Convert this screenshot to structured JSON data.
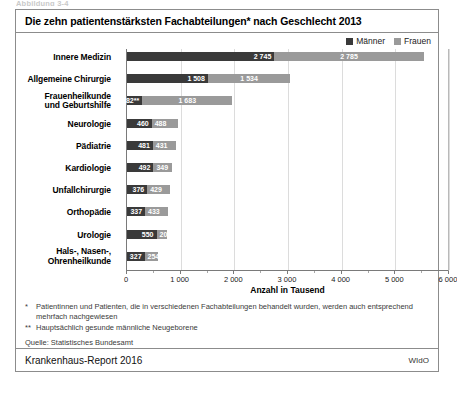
{
  "pre_caption": "Abbildung 3-4",
  "figure": {
    "title": "Die zehn patientenstärksten Fachabteilungen* nach Geschlecht 2013",
    "legend": [
      {
        "label": "Männer",
        "color": "#3a3a3a"
      },
      {
        "label": "Frauen",
        "color": "#9a9a9a"
      }
    ],
    "notes": [
      {
        "mark": "*",
        "text": "Patientinnen und Patienten, die in verschiedenen Fachabteilungen behandelt wurden, werden auch entsprechend mehrfach nachgewiesen"
      },
      {
        "mark": "**",
        "text": "Hauptsächlich gesunde männliche Neugeborene"
      }
    ],
    "source": "Quelle: Statistisches Bundesamt",
    "footer_left": "Krankenhaus-Report 2016",
    "footer_right": "WIdO"
  },
  "chart_data": {
    "type": "bar",
    "orientation": "horizontal",
    "stacked": true,
    "title": "Die zehn patientenstärksten Fachabteilungen* nach Geschlecht 2013",
    "xlabel": "Anzahl in Tausend",
    "ylabel": "",
    "xlim": [
      0,
      6000
    ],
    "xticks": [
      0,
      1000,
      2000,
      3000,
      4000,
      5000,
      6000
    ],
    "xticklabels": [
      "0",
      "1 000",
      "2 000",
      "3 000",
      "4 000",
      "5 000",
      "6 000"
    ],
    "grid": true,
    "legend_position": "top-right",
    "categories": [
      "Innere Medizin",
      "Allgemeine Chirurgie",
      "Frauenheilkunde und Geburtshilfe",
      "Neurologie",
      "Pädiatrie",
      "Kardiologie",
      "Unfallchirurgie",
      "Orthopädie",
      "Urologie",
      "Hals-, Nasen-, Ohrenheilkunde"
    ],
    "series": [
      {
        "name": "Männer",
        "color": "#3a3a3a",
        "values": [
          2745,
          1508,
          282,
          460,
          481,
          492,
          376,
          337,
          550,
          327
        ]
      },
      {
        "name": "Frauen",
        "color": "#9a9a9a",
        "values": [
          2785,
          1534,
          1683,
          488,
          431,
          349,
          429,
          433,
          200,
          254
        ]
      }
    ],
    "data_labels": {
      "Männer": [
        "2 745",
        "1 508",
        "282**",
        "460",
        "481",
        "492",
        "376",
        "337",
        "550",
        "327"
      ],
      "Frauen": [
        "2 785",
        "1 534",
        "1 683",
        "488",
        "431",
        "349",
        "429",
        "433",
        "200",
        "254"
      ]
    },
    "annotations": [
      "282** — Hauptsächlich gesunde männliche Neugeborene"
    ]
  }
}
